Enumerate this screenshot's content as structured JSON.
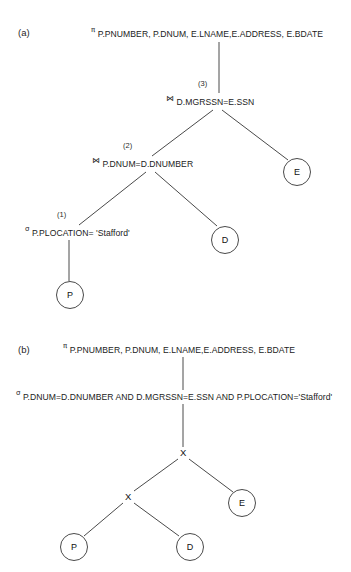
{
  "figure": {
    "background": "#ffffff",
    "line_color": "#4a4a4a",
    "text_color": "#1a1a1a"
  },
  "parts": {
    "a": {
      "label": "(a)",
      "nodes": {
        "projection": {
          "symbol": "π",
          "symbol_name": "pi-projection-operator",
          "text": "P.PNUMBER, P.DNUM, E.LNAME,E.ADDRESS, E.BDATE"
        },
        "join_top": {
          "symbol": "⋈",
          "symbol_name": "bowtie-join-operator",
          "text": "D.MGRSSN=E.SSN",
          "step": "(3)"
        },
        "join_lower": {
          "symbol": "⋈",
          "symbol_name": "bowtie-join-operator",
          "text": "P.DNUM=D.DNUMBER",
          "step": "(2)"
        },
        "selection": {
          "symbol": "σ",
          "symbol_name": "sigma-selection-operator",
          "text": "P.PLOCATION= 'Stafford'",
          "step": "(1)"
        },
        "relation_p": "P",
        "relation_d": "D",
        "relation_e": "E"
      }
    },
    "b": {
      "label": "(b)",
      "nodes": {
        "projection": {
          "symbol": "π",
          "symbol_name": "pi-projection-operator",
          "text": "P.PNUMBER, P.DNUM, E.LNAME,E.ADDRESS, E.BDATE"
        },
        "selection": {
          "symbol": "σ",
          "symbol_name": "sigma-selection-operator",
          "text": "P.DNUM=D.DNUMBER AND D.MGRSSN=E.SSN AND P.PLOCATION='Stafford'"
        },
        "product_top": "X",
        "product_lower": "X",
        "relation_p": "P",
        "relation_d": "D",
        "relation_e": "E"
      }
    }
  }
}
